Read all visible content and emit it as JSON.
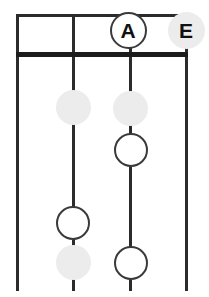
{
  "diagram": {
    "type": "string-instrument-fretboard",
    "colors": {
      "line": "#2b2b2b",
      "nut": "#1c1c1c",
      "marker_open_fill": "#ffffff",
      "marker_open_stroke": "#3a3a3a",
      "marker_filled_fill": "#ececec",
      "label_text": "#111111",
      "background": "#ffffff"
    },
    "geometry": {
      "width": 209,
      "height": 297,
      "string_x": [
        17,
        73,
        130,
        186
      ],
      "nut_y": 52,
      "top_fret_y": 14,
      "bottom_y": 291
    },
    "strings": [
      {
        "name": "string-1",
        "x": 17
      },
      {
        "name": "string-2",
        "x": 73
      },
      {
        "name": "string-3",
        "x": 130
      },
      {
        "name": "string-4",
        "x": 186
      }
    ],
    "frets": [
      {
        "name": "fret-top",
        "y": 14,
        "style": "thin"
      },
      {
        "name": "nut",
        "y": 52,
        "style": "thick"
      }
    ],
    "markers": [
      {
        "id": "marker-a",
        "label": "A",
        "x": 128,
        "y": 30,
        "d": 37,
        "style": "open",
        "has_label": true
      },
      {
        "id": "marker-e",
        "label": "E",
        "x": 186,
        "y": 30,
        "d": 37,
        "style": "filled",
        "has_label": true
      },
      {
        "id": "marker-s2-f1",
        "label": "",
        "x": 73,
        "y": 107,
        "d": 35,
        "style": "filled",
        "has_label": false
      },
      {
        "id": "marker-s3-f1",
        "label": "",
        "x": 130,
        "y": 108,
        "d": 35,
        "style": "filled",
        "has_label": false
      },
      {
        "id": "marker-s3-f2",
        "label": "",
        "x": 131,
        "y": 150,
        "d": 34,
        "style": "open",
        "has_label": false
      },
      {
        "id": "marker-s2-f3",
        "label": "",
        "x": 73,
        "y": 223,
        "d": 34,
        "style": "open",
        "has_label": false
      },
      {
        "id": "marker-s2-f4",
        "label": "",
        "x": 73,
        "y": 262,
        "d": 35,
        "style": "filled",
        "has_label": false
      },
      {
        "id": "marker-s3-f4",
        "label": "",
        "x": 131,
        "y": 263,
        "d": 34,
        "style": "open",
        "has_label": false
      }
    ]
  }
}
